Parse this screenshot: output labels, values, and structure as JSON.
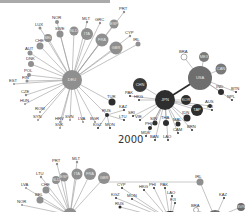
{
  "figure": {
    "year_label": "2000",
    "colors": {
      "europe_node": "#8f8f8f",
      "asia_node": "#2e2e2e",
      "america_node": "#6e6e6e",
      "edge": "#9a9a9a",
      "hollow_node_stroke": "#777777"
    }
  },
  "panel_top": {
    "hubs": [
      {
        "id": "DEU",
        "x": 72,
        "y": 80,
        "r": 10,
        "color": "#8f8f8f"
      },
      {
        "id": "JPN",
        "x": 165,
        "y": 100,
        "r": 10,
        "color": "#2e2e2e"
      },
      {
        "id": "USA",
        "x": 200,
        "y": 78,
        "r": 12,
        "color": "#6e6e6e"
      },
      {
        "id": "CHN",
        "x": 140,
        "y": 85,
        "r": 7,
        "color": "#3a3a3a"
      }
    ],
    "deu_neighbors": [
      {
        "id": "NOR",
        "x": 57,
        "y": 22,
        "r": 2
      },
      {
        "id": "LUX",
        "x": 40,
        "y": 28,
        "r": 1.5
      },
      {
        "id": "SWE",
        "x": 60,
        "y": 34,
        "r": 3.5
      },
      {
        "id": "NLD",
        "x": 74,
        "y": 31,
        "r": 4.5
      },
      {
        "id": "MLT",
        "x": 87,
        "y": 22,
        "r": 1.2
      },
      {
        "id": "ITA",
        "x": 87,
        "y": 34,
        "r": 6
      },
      {
        "id": "GRC",
        "x": 100,
        "y": 23,
        "r": 1.2
      },
      {
        "id": "FRA",
        "x": 102,
        "y": 40,
        "r": 6.5
      },
      {
        "id": "ESP",
        "x": 114,
        "y": 24,
        "r": 4.5
      },
      {
        "id": "GBR",
        "x": 116,
        "y": 48,
        "r": 6.5
      },
      {
        "id": "PRT",
        "x": 124,
        "y": 12,
        "r": 1.2
      },
      {
        "id": "CYP",
        "x": 130,
        "y": 36,
        "r": 1.2
      },
      {
        "id": "IRL",
        "x": 138,
        "y": 44,
        "r": 2.5
      },
      {
        "id": "BEL",
        "x": 48,
        "y": 38,
        "r": 4
      },
      {
        "id": "CHE",
        "x": 40,
        "y": 46,
        "r": 3.5
      },
      {
        "id": "AUT",
        "x": 30,
        "y": 53,
        "r": 2.5
      },
      {
        "id": "DNK",
        "x": 31,
        "y": 64,
        "r": 3
      },
      {
        "id": "POL",
        "x": 29,
        "y": 75,
        "r": 2
      },
      {
        "id": "FIN",
        "x": 27,
        "y": 81,
        "r": 1.5
      },
      {
        "id": "EST",
        "x": 14,
        "y": 84,
        "r": 1
      },
      {
        "id": "CZE",
        "x": 26,
        "y": 95,
        "r": 1.2
      },
      {
        "id": "HUN",
        "x": 25,
        "y": 104,
        "r": 1
      },
      {
        "id": "ROM",
        "x": 40,
        "y": 112,
        "r": 1
      },
      {
        "id": "SYN",
        "x": 38,
        "y": 120,
        "r": 1
      },
      {
        "id": "HRV",
        "x": 60,
        "y": 122,
        "r": 1
      },
      {
        "id": "SVK",
        "x": 60,
        "y": 128,
        "r": 1
      },
      {
        "id": "SVN",
        "x": 70,
        "y": 120,
        "r": 1
      },
      {
        "id": "LVA",
        "x": 83,
        "y": 122,
        "r": 1
      },
      {
        "id": "BGR",
        "x": 95,
        "y": 122,
        "r": 1
      },
      {
        "id": "TUR",
        "x": 112,
        "y": 102,
        "r": 3.5
      }
    ],
    "rus_cluster": [
      {
        "id": "RUS",
        "x": 107,
        "y": 115,
        "r": 2
      },
      {
        "id": "KGZ",
        "x": 98,
        "y": 128,
        "r": 1
      },
      {
        "id": "MON",
        "x": 110,
        "y": 128,
        "r": 1
      },
      {
        "id": "KAZ",
        "x": 124,
        "y": 110,
        "r": 1
      },
      {
        "id": "LTU",
        "x": 124,
        "y": 120,
        "r": 1
      }
    ],
    "asia_neighbors": [
      {
        "id": "PAK",
        "x": 130,
        "y": 96,
        "r": 1
      },
      {
        "id": "HKG",
        "x": 139,
        "y": 100,
        "r": 1
      },
      {
        "id": "KOR",
        "x": 186,
        "y": 100,
        "r": 5
      },
      {
        "id": "TAP",
        "x": 197,
        "y": 110,
        "r": 6
      },
      {
        "id": "FJI",
        "x": 212,
        "y": 110,
        "r": 1
      },
      {
        "id": "AUS",
        "x": 210,
        "y": 106,
        "r": 2
      },
      {
        "id": "IDN",
        "x": 187,
        "y": 118,
        "r": 3.5
      },
      {
        "id": "BRN",
        "x": 192,
        "y": 130,
        "r": 1
      },
      {
        "id": "MAL",
        "x": 178,
        "y": 124,
        "r": 2.5
      },
      {
        "id": "CAM",
        "x": 178,
        "y": 133,
        "r": 1
      },
      {
        "id": "THA",
        "x": 166,
        "y": 123,
        "r": 3
      },
      {
        "id": "LAO",
        "x": 168,
        "y": 140,
        "r": 1
      },
      {
        "id": "SIN",
        "x": 155,
        "y": 123,
        "r": 2.5
      },
      {
        "id": "BAN",
        "x": 155,
        "y": 140,
        "r": 1
      },
      {
        "id": "MDV",
        "x": 146,
        "y": 136,
        "r": 1
      },
      {
        "id": "PHI",
        "x": 150,
        "y": 128,
        "r": 2
      },
      {
        "id": "VIE",
        "x": 140,
        "y": 120,
        "r": 1
      },
      {
        "id": "SRI",
        "x": 133,
        "y": 116,
        "r": 1
      }
    ],
    "usa_neighbors": [
      {
        "id": "BRA",
        "x": 184,
        "y": 57,
        "r": 3,
        "hollow": true
      },
      {
        "id": "MEX",
        "x": 204,
        "y": 57,
        "r": 5
      },
      {
        "id": "CAN",
        "x": 221,
        "y": 69,
        "r": 5.5
      },
      {
        "id": "IND",
        "x": 221,
        "y": 92,
        "r": 3
      },
      {
        "id": "BTN",
        "x": 236,
        "y": 92,
        "r": 1
      },
      {
        "id": "NPL",
        "x": 232,
        "y": 100,
        "r": 1
      }
    ]
  },
  "panel_bottom": {
    "visible_nodes": [
      {
        "id": "PRT",
        "x": 57,
        "y": 164,
        "r": 1.2
      },
      {
        "id": "MLT",
        "x": 77,
        "y": 162,
        "r": 1.2
      },
      {
        "id": "LTU",
        "x": 41,
        "y": 177,
        "r": 1.2
      },
      {
        "id": "NLD",
        "x": 56,
        "y": 180,
        "r": 4
      },
      {
        "id": "ESP",
        "x": 64,
        "y": 177,
        "r": 4.5
      },
      {
        "id": "ITA",
        "x": 77,
        "y": 174,
        "r": 5.5
      },
      {
        "id": "FRA",
        "x": 90,
        "y": 174,
        "r": 6
      },
      {
        "id": "GBR",
        "x": 104,
        "y": 178,
        "r": 6
      },
      {
        "id": "LVA",
        "x": 26,
        "y": 188,
        "r": 1
      },
      {
        "id": "CHE",
        "x": 46,
        "y": 190,
        "r": 3.5
      },
      {
        "id": "BEL",
        "x": 40,
        "y": 200,
        "r": 3.5
      },
      {
        "id": "NOR",
        "x": 22,
        "y": 205,
        "r": 1
      },
      {
        "id": "CYP",
        "x": 122,
        "y": 188,
        "r": 1
      },
      {
        "id": "KGZ",
        "x": 116,
        "y": 198,
        "r": 1
      },
      {
        "id": "RUS",
        "x": 120,
        "y": 207,
        "r": 1.5
      },
      {
        "id": "MON",
        "x": 132,
        "y": 199,
        "r": 1
      },
      {
        "id": "HKG",
        "x": 144,
        "y": 190,
        "r": 1
      },
      {
        "id": "PHI",
        "x": 154,
        "y": 188,
        "r": 1
      },
      {
        "id": "PAK",
        "x": 165,
        "y": 188,
        "r": 1
      },
      {
        "id": "LAO",
        "x": 172,
        "y": 196,
        "r": 1
      },
      {
        "id": "FJI",
        "x": 175,
        "y": 203,
        "r": 1
      },
      {
        "id": "IRL",
        "x": 200,
        "y": 182,
        "r": 3.5
      },
      {
        "id": "KAZ",
        "x": 224,
        "y": 198,
        "r": 1
      },
      {
        "id": "BRA",
        "x": 196,
        "y": 210,
        "r": 2.5,
        "hollow": true
      },
      {
        "id": "SVN",
        "x": 241,
        "y": 207,
        "r": 4
      }
    ]
  }
}
